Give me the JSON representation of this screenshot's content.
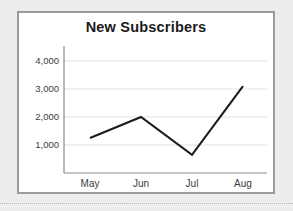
{
  "card": {
    "border_color": "#9a9a9a",
    "background": "#ffffff"
  },
  "page": {
    "background": "#ededed"
  },
  "separator": {
    "style": "dotted",
    "color": "#b4b4b4"
  },
  "chart_data": {
    "type": "line",
    "title": "New Subscribers",
    "xlabel": "",
    "ylabel": "",
    "categories": [
      "May",
      "Jun",
      "Jul",
      "Aug"
    ],
    "values": [
      1250,
      2000,
      650,
      3100
    ],
    "series": [
      {
        "name": "New Subscribers",
        "values": [
          1250,
          2000,
          650,
          3100
        ],
        "color": "#1c1c1c"
      }
    ],
    "ylim": [
      0,
      4500
    ],
    "yticks": [
      1000,
      2000,
      3000,
      4000
    ],
    "ytick_labels": [
      "1,000",
      "2,000",
      "3,000",
      "4,000"
    ],
    "xtick_labels": [
      "May",
      "Jun",
      "Jul",
      "Aug"
    ],
    "grid": true,
    "grid_axis": "y",
    "legend": false,
    "legend_position": "none",
    "markers": false,
    "line_color": "#1c1c1c",
    "grid_color": "#e2e2e2",
    "axis_color": "#8c8c8c"
  }
}
